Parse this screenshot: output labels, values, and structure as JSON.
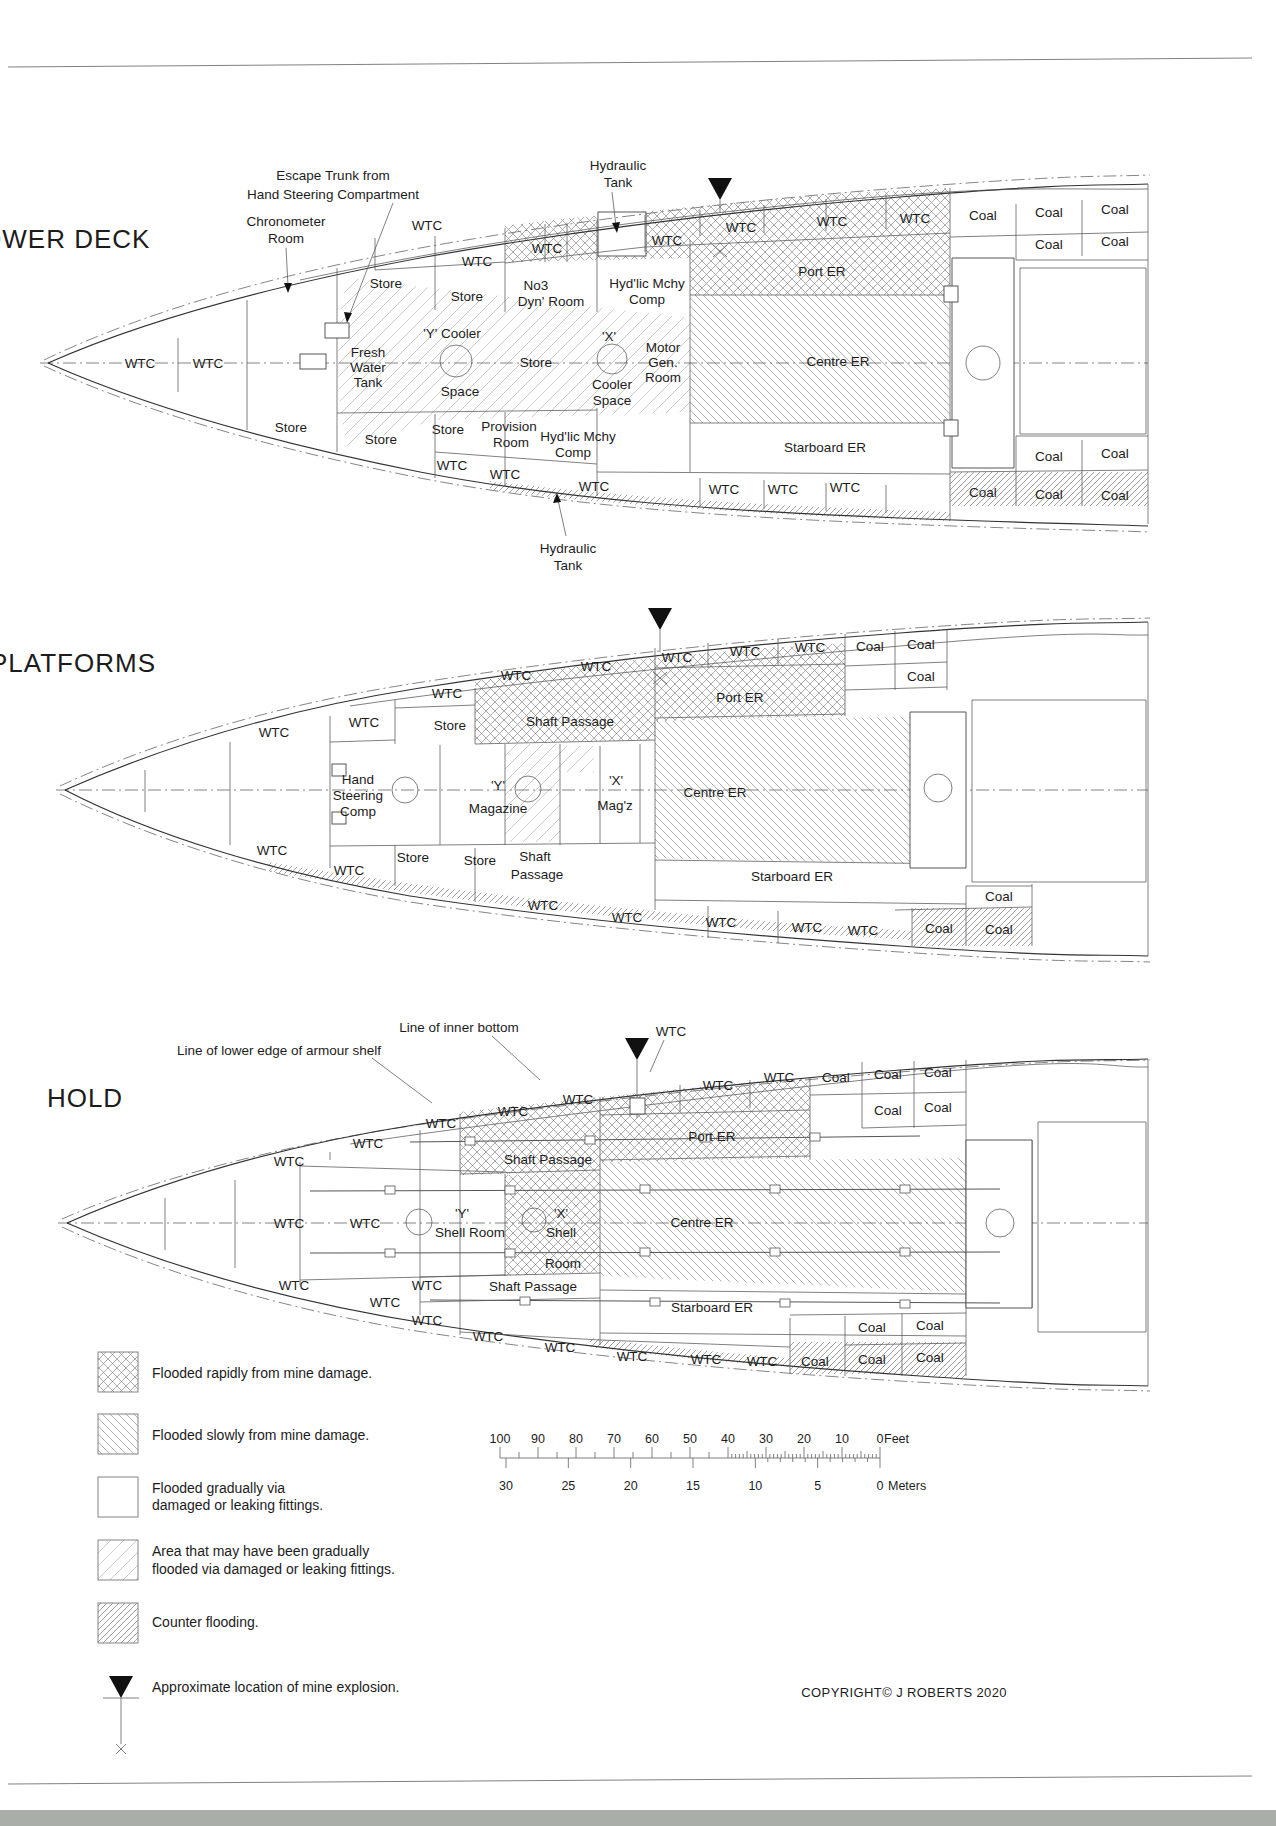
{
  "header": {
    "cropped_top_text": "A SERIES OF UNFORTUNATE EVENTS"
  },
  "decks": [
    {
      "id": "lower-deck",
      "title": "LOWER DECK",
      "labels": [
        {
          "t": "LOWER DECK",
          "x": 58,
          "y": 248,
          "k": "title",
          "a": "s"
        },
        {
          "t": "Escape Trunk from",
          "x": 333,
          "y": 180,
          "k": "ann",
          "a": "s"
        },
        {
          "t": "Hand Steering Compartment",
          "x": 333,
          "y": 199,
          "k": "ann",
          "a": "s"
        },
        {
          "t": "Chronometer",
          "x": 286,
          "y": 226,
          "k": "ann"
        },
        {
          "t": "Room",
          "x": 286,
          "y": 243,
          "k": "ann"
        },
        {
          "t": "Hydraulic",
          "x": 618,
          "y": 170,
          "k": "ann"
        },
        {
          "t": "Tank",
          "x": 618,
          "y": 187,
          "k": "ann"
        },
        {
          "t": "WTC",
          "x": 140,
          "y": 368
        },
        {
          "t": "WTC",
          "x": 208,
          "y": 368
        },
        {
          "t": "Store",
          "x": 386,
          "y": 288
        },
        {
          "t": "WTC",
          "x": 427,
          "y": 230
        },
        {
          "t": "WTC",
          "x": 477,
          "y": 266
        },
        {
          "t": "Store",
          "x": 467,
          "y": 301
        },
        {
          "t": "Fresh",
          "x": 368,
          "y": 357
        },
        {
          "t": "Water",
          "x": 368,
          "y": 372
        },
        {
          "t": "Tank",
          "x": 368,
          "y": 387
        },
        {
          "t": "'Y' Cooler",
          "x": 452,
          "y": 338
        },
        {
          "t": "Space",
          "x": 460,
          "y": 396
        },
        {
          "t": "Store",
          "x": 536,
          "y": 367
        },
        {
          "t": "'X'",
          "x": 609,
          "y": 341
        },
        {
          "t": "Cooler",
          "x": 612,
          "y": 389
        },
        {
          "t": "Space",
          "x": 612,
          "y": 405
        },
        {
          "t": "Motor",
          "x": 663,
          "y": 352
        },
        {
          "t": "Gen.",
          "x": 663,
          "y": 367
        },
        {
          "t": "Room",
          "x": 663,
          "y": 382
        },
        {
          "t": "No3",
          "x": 536,
          "y": 290
        },
        {
          "t": "Dyn' Room",
          "x": 551,
          "y": 306
        },
        {
          "t": "Hyd'lic Mchy",
          "x": 647,
          "y": 288
        },
        {
          "t": "Comp",
          "x": 647,
          "y": 304
        },
        {
          "t": "WTC",
          "x": 547,
          "y": 253
        },
        {
          "t": "WTC",
          "x": 667,
          "y": 245
        },
        {
          "t": "WTC",
          "x": 741,
          "y": 232
        },
        {
          "t": "WTC",
          "x": 832,
          "y": 226
        },
        {
          "t": "WTC",
          "x": 915,
          "y": 223
        },
        {
          "t": "Coal",
          "x": 983,
          "y": 220
        },
        {
          "t": "Coal",
          "x": 1049,
          "y": 217
        },
        {
          "t": "Coal",
          "x": 1115,
          "y": 214
        },
        {
          "t": "Coal",
          "x": 1049,
          "y": 249
        },
        {
          "t": "Coal",
          "x": 1115,
          "y": 246
        },
        {
          "t": "Port ER",
          "x": 822,
          "y": 276
        },
        {
          "t": "Centre ER",
          "x": 838,
          "y": 366
        },
        {
          "t": "Starboard ER",
          "x": 825,
          "y": 452
        },
        {
          "t": "Store",
          "x": 291,
          "y": 432
        },
        {
          "t": "Store",
          "x": 381,
          "y": 444
        },
        {
          "t": "Store",
          "x": 448,
          "y": 434
        },
        {
          "t": "Provision",
          "x": 509,
          "y": 431
        },
        {
          "t": "Room",
          "x": 511,
          "y": 447
        },
        {
          "t": "Hyd'lic Mchy",
          "x": 578,
          "y": 441
        },
        {
          "t": "Comp",
          "x": 573,
          "y": 457
        },
        {
          "t": "WTC",
          "x": 452,
          "y": 470
        },
        {
          "t": "WTC",
          "x": 505,
          "y": 479
        },
        {
          "t": "WTC",
          "x": 594,
          "y": 491
        },
        {
          "t": "WTC",
          "x": 724,
          "y": 494
        },
        {
          "t": "WTC",
          "x": 783,
          "y": 494
        },
        {
          "t": "WTC",
          "x": 845,
          "y": 492
        },
        {
          "t": "Coal",
          "x": 983,
          "y": 497
        },
        {
          "t": "Coal",
          "x": 1049,
          "y": 499
        },
        {
          "t": "Coal",
          "x": 1115,
          "y": 500
        },
        {
          "t": "Coal",
          "x": 1049,
          "y": 461
        },
        {
          "t": "Coal",
          "x": 1115,
          "y": 458
        },
        {
          "t": "Hydraulic",
          "x": 568,
          "y": 553,
          "k": "ann"
        },
        {
          "t": "Tank",
          "x": 568,
          "y": 570,
          "k": "ann"
        }
      ]
    },
    {
      "id": "platforms",
      "title": "PLATFORMS",
      "labels": [
        {
          "t": "PLATFORMS",
          "x": 73,
          "y": 672,
          "k": "title",
          "a": "s"
        },
        {
          "t": "WTC",
          "x": 274,
          "y": 737
        },
        {
          "t": "WTC",
          "x": 364,
          "y": 727
        },
        {
          "t": "WTC",
          "x": 447,
          "y": 698
        },
        {
          "t": "Store",
          "x": 450,
          "y": 730
        },
        {
          "t": "WTC",
          "x": 516,
          "y": 680
        },
        {
          "t": "WTC",
          "x": 596,
          "y": 671
        },
        {
          "t": "Shaft Passage",
          "x": 570,
          "y": 726
        },
        {
          "t": "WTC",
          "x": 677,
          "y": 662
        },
        {
          "t": "WTC",
          "x": 745,
          "y": 656
        },
        {
          "t": "WTC",
          "x": 810,
          "y": 652
        },
        {
          "t": "Coal",
          "x": 870,
          "y": 651
        },
        {
          "t": "Coal",
          "x": 921,
          "y": 649
        },
        {
          "t": "Coal",
          "x": 921,
          "y": 681
        },
        {
          "t": "Port ER",
          "x": 740,
          "y": 702
        },
        {
          "t": "Centre ER",
          "x": 715,
          "y": 797
        },
        {
          "t": "Starboard ER",
          "x": 792,
          "y": 881
        },
        {
          "t": "Hand",
          "x": 358,
          "y": 784
        },
        {
          "t": "Steering",
          "x": 358,
          "y": 800
        },
        {
          "t": "Comp",
          "x": 358,
          "y": 816
        },
        {
          "t": "'Y'",
          "x": 498,
          "y": 790
        },
        {
          "t": "Magazine",
          "x": 498,
          "y": 813
        },
        {
          "t": "'X'",
          "x": 616,
          "y": 785
        },
        {
          "t": "Mag'z",
          "x": 615,
          "y": 810
        },
        {
          "t": "WTC",
          "x": 272,
          "y": 855
        },
        {
          "t": "WTC",
          "x": 349,
          "y": 875
        },
        {
          "t": "Store",
          "x": 413,
          "y": 862
        },
        {
          "t": "Store",
          "x": 480,
          "y": 865
        },
        {
          "t": "Shaft",
          "x": 535,
          "y": 861
        },
        {
          "t": "Passage",
          "x": 537,
          "y": 879
        },
        {
          "t": "WTC",
          "x": 543,
          "y": 910
        },
        {
          "t": "WTC",
          "x": 627,
          "y": 922
        },
        {
          "t": "WTC",
          "x": 721,
          "y": 927
        },
        {
          "t": "WTC",
          "x": 807,
          "y": 932
        },
        {
          "t": "WTC",
          "x": 863,
          "y": 935
        },
        {
          "t": "Coal",
          "x": 939,
          "y": 933
        },
        {
          "t": "Coal",
          "x": 999,
          "y": 934
        },
        {
          "t": "Coal",
          "x": 999,
          "y": 901
        }
      ]
    },
    {
      "id": "hold",
      "title": "HOLD",
      "labels": [
        {
          "t": "HOLD",
          "x": 85,
          "y": 1107,
          "k": "title",
          "a": "s"
        },
        {
          "t": "Line of lower edge of armour shelf",
          "x": 279,
          "y": 1055,
          "k": "ann"
        },
        {
          "t": "Line of inner bottom",
          "x": 459,
          "y": 1032,
          "k": "ann"
        },
        {
          "t": "WTC",
          "x": 671,
          "y": 1036,
          "k": "ann"
        },
        {
          "t": "WTC",
          "x": 289,
          "y": 1166
        },
        {
          "t": "WTC",
          "x": 368,
          "y": 1148
        },
        {
          "t": "WTC",
          "x": 441,
          "y": 1128
        },
        {
          "t": "WTC",
          "x": 513,
          "y": 1116
        },
        {
          "t": "WTC",
          "x": 578,
          "y": 1104
        },
        {
          "t": "Shaft Passage",
          "x": 548,
          "y": 1164
        },
        {
          "t": "WTC",
          "x": 718,
          "y": 1090
        },
        {
          "t": "WTC",
          "x": 779,
          "y": 1082
        },
        {
          "t": "Coal",
          "x": 836,
          "y": 1082
        },
        {
          "t": "Coal",
          "x": 888,
          "y": 1079
        },
        {
          "t": "Coal",
          "x": 938,
          "y": 1077
        },
        {
          "t": "Coal",
          "x": 888,
          "y": 1115
        },
        {
          "t": "Coal",
          "x": 938,
          "y": 1112
        },
        {
          "t": "Port ER",
          "x": 712,
          "y": 1141
        },
        {
          "t": "Centre ER",
          "x": 702,
          "y": 1227
        },
        {
          "t": "WTC",
          "x": 289,
          "y": 1228
        },
        {
          "t": "WTC",
          "x": 365,
          "y": 1228
        },
        {
          "t": "'Y'",
          "x": 462,
          "y": 1218
        },
        {
          "t": "Shell Room",
          "x": 470,
          "y": 1237
        },
        {
          "t": "'X'",
          "x": 561,
          "y": 1218
        },
        {
          "t": "Shell",
          "x": 561,
          "y": 1237
        },
        {
          "t": "Room",
          "x": 563,
          "y": 1268
        },
        {
          "t": "WTC",
          "x": 427,
          "y": 1290
        },
        {
          "t": "Shaft Passage",
          "x": 533,
          "y": 1291
        },
        {
          "t": "Starboard ER",
          "x": 712,
          "y": 1312
        },
        {
          "t": "WTC",
          "x": 294,
          "y": 1290
        },
        {
          "t": "WTC",
          "x": 385,
          "y": 1307
        },
        {
          "t": "WTC",
          "x": 427,
          "y": 1325
        },
        {
          "t": "WTC",
          "x": 488,
          "y": 1341
        },
        {
          "t": "WTC",
          "x": 560,
          "y": 1352
        },
        {
          "t": "WTC",
          "x": 632,
          "y": 1361
        },
        {
          "t": "WTC",
          "x": 706,
          "y": 1364
        },
        {
          "t": "WTC",
          "x": 762,
          "y": 1366
        },
        {
          "t": "Coal",
          "x": 815,
          "y": 1366
        },
        {
          "t": "Coal",
          "x": 872,
          "y": 1364
        },
        {
          "t": "Coal",
          "x": 930,
          "y": 1362
        },
        {
          "t": "Coal",
          "x": 872,
          "y": 1332
        },
        {
          "t": "Coal",
          "x": 930,
          "y": 1330
        }
      ]
    }
  ],
  "legend": {
    "items": [
      {
        "key": "flooded-rapidly",
        "pattern": "crosshatch",
        "lines": [
          "Flooded rapidly from mine damage."
        ]
      },
      {
        "key": "flooded-slowly",
        "pattern": "diagonal-backslash",
        "lines": [
          "Flooded slowly from mine damage."
        ]
      },
      {
        "key": "flooded-gradually",
        "pattern": "none",
        "lines": [
          "Flooded gradually via",
          "damaged or leaking fittings."
        ]
      },
      {
        "key": "maybe-flooded-gradually",
        "pattern": "diagonal-light",
        "lines": [
          "Area that may have been gradually",
          "flooded via damaged or leaking fittings."
        ]
      },
      {
        "key": "counter-flooding",
        "pattern": "diagonal-dense",
        "lines": [
          "Counter flooding."
        ]
      },
      {
        "key": "mine-explosion",
        "pattern": "mine-marker",
        "lines": [
          "Approximate location of mine explosion."
        ]
      }
    ]
  },
  "scale": {
    "feet_ticks": [
      "100",
      "90",
      "80",
      "70",
      "60",
      "50",
      "40",
      "30",
      "20",
      "10",
      "0"
    ],
    "feet_unit": "Feet",
    "meters_ticks": [
      "30",
      "25",
      "20",
      "15",
      "10",
      "5",
      "0"
    ],
    "meters_unit": "Meters"
  },
  "copyright": "COPYRIGHT© J ROBERTS 2020"
}
